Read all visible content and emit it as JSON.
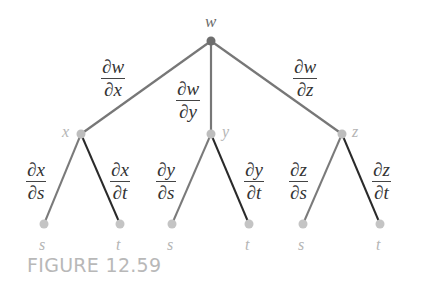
{
  "diagram": {
    "colors": {
      "root_node": "#6e6e6e",
      "mid_node": "#bdbdbd",
      "leaf_node": "#c4c4c4",
      "edge_upper": "#777777",
      "edge_left": "#7a7a7a",
      "edge_right": "#2a2a2a",
      "root_label": "#6a6a6a",
      "mid_label": "#b5b5b5",
      "leaf_label": "#b5b5b5",
      "caption": "#b8b8b8"
    },
    "nodes": {
      "root": {
        "label": "w"
      },
      "mid": [
        {
          "label": "x"
        },
        {
          "label": "y"
        },
        {
          "label": "z"
        }
      ],
      "leaves": [
        {
          "label": "s"
        },
        {
          "label": "t"
        },
        {
          "label": "s"
        },
        {
          "label": "t"
        },
        {
          "label": "s"
        },
        {
          "label": "t"
        }
      ]
    },
    "edge_labels": {
      "upper": [
        {
          "num": "∂w",
          "den": "∂x"
        },
        {
          "num": "∂w",
          "den": "∂y"
        },
        {
          "num": "∂w",
          "den": "∂z"
        }
      ],
      "lower": [
        {
          "num": "∂x",
          "den": "∂s"
        },
        {
          "num": "∂x",
          "den": "∂t"
        },
        {
          "num": "∂y",
          "den": "∂s"
        },
        {
          "num": "∂y",
          "den": "∂t"
        },
        {
          "num": "∂z",
          "den": "∂s"
        },
        {
          "num": "∂z",
          "den": "∂t"
        }
      ]
    },
    "caption": "FIGURE 12.59"
  }
}
